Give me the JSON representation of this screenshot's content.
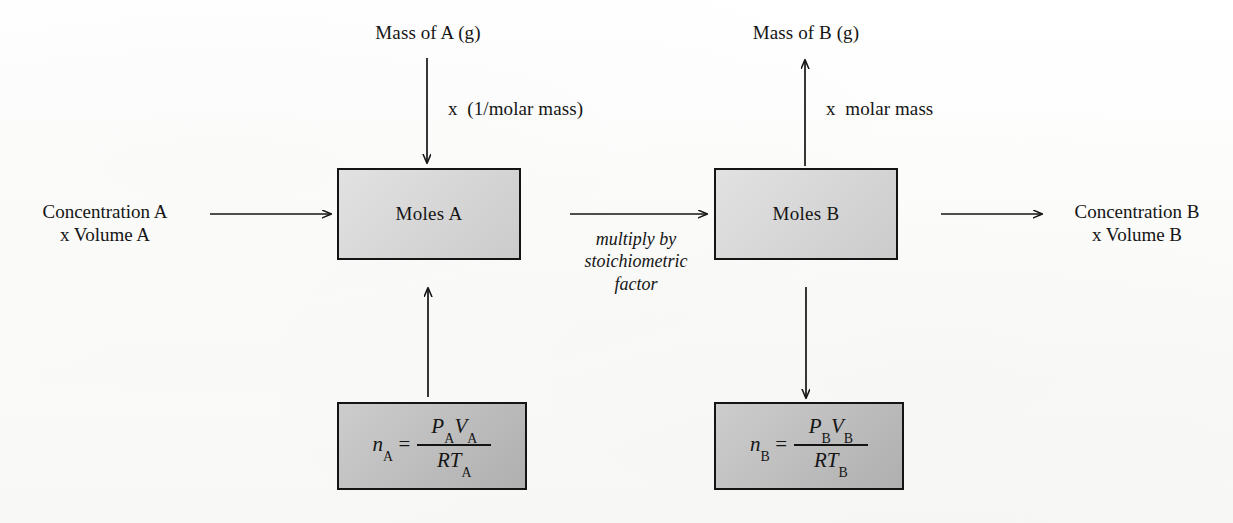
{
  "diagram": {
    "colors": {
      "box_light_fill": "#d2d2d2",
      "box_dark_fill": "#b9b9b9",
      "border": "#141414",
      "background": "#fdfdfc",
      "text": "#151515"
    },
    "top_labels": {
      "mass_a": "Mass of A (g)",
      "mass_b": "Mass of B (g)"
    },
    "arrow_labels": {
      "mass_a_to_moles_a": "x  (1/molar mass)",
      "moles_b_to_mass_b": "x  molar mass",
      "stoichiometric_line1": "multiply by",
      "stoichiometric_line2": "stoichiometric",
      "stoichiometric_line3": "factor"
    },
    "side_labels": {
      "left_line1": "Concentration A",
      "left_line2": "x Volume A",
      "right_line1": "Concentration B",
      "right_line2": "x Volume B"
    },
    "boxes": {
      "moles_a": "Moles A",
      "moles_b": "Moles B"
    },
    "formulas": {
      "a": {
        "lhs_var": "n",
        "lhs_sub": "A",
        "equals": "=",
        "num_var1": "P",
        "num_sub1": "A",
        "num_var2": "V",
        "num_sub2": "A",
        "den_var1": "R",
        "den_var2": "T",
        "den_sub2": "A",
        "plain": "n_A = P_A V_A / R T_A"
      },
      "b": {
        "lhs_var": "n",
        "lhs_sub": "B",
        "equals": "=",
        "num_var1": "P",
        "num_sub1": "B",
        "num_var2": "V",
        "num_sub2": "B",
        "den_var1": "R",
        "den_var2": "T",
        "den_sub2": "B",
        "plain": "n_B = P_B V_B / R T_B"
      }
    }
  }
}
